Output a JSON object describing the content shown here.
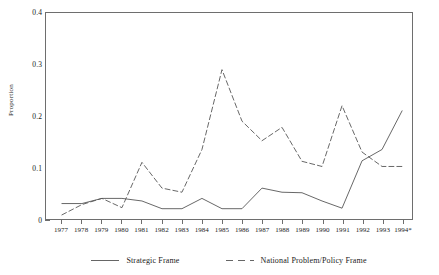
{
  "chart_data": {
    "type": "line",
    "title": "",
    "subtitle": "",
    "xlabel": "",
    "ylabel": "Proportion",
    "ylim": [
      0,
      0.4
    ],
    "y_major_ticks": [
      0,
      0.1,
      0.2,
      0.3,
      0.4
    ],
    "y_major_tick_labels": [
      "0",
      "0.1",
      "0.2",
      "0.3",
      "0.4"
    ],
    "y_minor_ticks": [
      0.05,
      0.15,
      0.25,
      0.35
    ],
    "grid": false,
    "legend_position": "bottom",
    "categories": [
      "1977",
      "1978",
      "1979",
      "1980",
      "1981",
      "1982",
      "1983",
      "1984",
      "1985",
      "1986",
      "1987",
      "1988",
      "1989",
      "1990",
      "1991",
      "1992",
      "1993",
      "1994*"
    ],
    "x": [
      1977,
      1978,
      1979,
      1980,
      1981,
      1982,
      1983,
      1984,
      1985,
      1986,
      1987,
      1988,
      1989,
      1990,
      1991,
      1992,
      1993,
      1994
    ],
    "series": [
      {
        "name": "Strategic Frame",
        "style": "solid",
        "color": "#555555",
        "values": [
          0.03,
          0.03,
          0.04,
          0.04,
          0.035,
          0.02,
          0.02,
          0.04,
          0.02,
          0.02,
          0.06,
          0.052,
          0.051,
          0.035,
          0.021,
          0.113,
          0.135,
          0.21
        ]
      },
      {
        "name": "National Problem/Policy Frame",
        "style": "dashed",
        "color": "#555555",
        "values": [
          0.008,
          0.028,
          0.04,
          0.022,
          0.11,
          0.06,
          0.052,
          0.135,
          0.29,
          0.19,
          0.152,
          0.178,
          0.112,
          0.102,
          0.22,
          0.13,
          0.102,
          0.102
        ]
      }
    ],
    "annotations": []
  },
  "legend": {
    "items": [
      {
        "label": "Strategic Frame",
        "icon": "solid-line-swatch"
      },
      {
        "label": "National Problem/Policy Frame",
        "icon": "dashed-line-swatch"
      }
    ]
  },
  "axis": {
    "y_title": "Proportion"
  },
  "colors": {
    "axis": "#6e6e6e",
    "line": "#555555",
    "text": "#1a1a1a",
    "background": "#ffffff"
  }
}
